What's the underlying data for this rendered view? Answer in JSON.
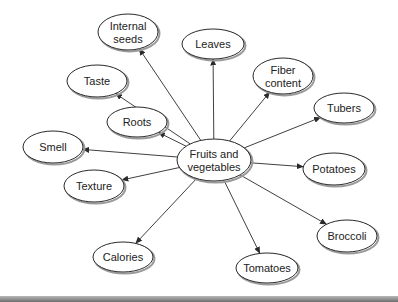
{
  "diagram": {
    "type": "concept-map",
    "center": {
      "id": "center",
      "lines": [
        "Fruits and",
        "vegetables"
      ],
      "cx": 214,
      "cy": 160,
      "rx": 37,
      "ry": 21
    },
    "nodes": [
      {
        "id": "internal-seeds",
        "lines": [
          "Internal",
          "seeds"
        ],
        "cx": 128,
        "cy": 32,
        "rx": 30,
        "ry": 18
      },
      {
        "id": "leaves",
        "lines": [
          "Leaves"
        ],
        "cx": 213,
        "cy": 44,
        "rx": 31,
        "ry": 15
      },
      {
        "id": "fiber-content",
        "lines": [
          "Fiber",
          "content"
        ],
        "cx": 283,
        "cy": 76,
        "rx": 30,
        "ry": 18
      },
      {
        "id": "tubers",
        "lines": [
          "Tubers"
        ],
        "cx": 344,
        "cy": 108,
        "rx": 30,
        "ry": 15
      },
      {
        "id": "taste",
        "lines": [
          "Taste"
        ],
        "cx": 97,
        "cy": 81,
        "rx": 30,
        "ry": 16
      },
      {
        "id": "roots",
        "lines": [
          "Roots"
        ],
        "cx": 137,
        "cy": 122,
        "rx": 30,
        "ry": 15
      },
      {
        "id": "smell",
        "lines": [
          "Smell"
        ],
        "cx": 53,
        "cy": 147,
        "rx": 30,
        "ry": 16
      },
      {
        "id": "potatoes",
        "lines": [
          "Potatoes"
        ],
        "cx": 334,
        "cy": 169,
        "rx": 31,
        "ry": 16
      },
      {
        "id": "texture",
        "lines": [
          "Texture"
        ],
        "cx": 94,
        "cy": 186,
        "rx": 30,
        "ry": 16
      },
      {
        "id": "broccoli",
        "lines": [
          "Broccoli"
        ],
        "cx": 347,
        "cy": 236,
        "rx": 30,
        "ry": 16
      },
      {
        "id": "calories",
        "lines": [
          "Calories"
        ],
        "cx": 123,
        "cy": 257,
        "rx": 30,
        "ry": 15
      },
      {
        "id": "tomatoes",
        "lines": [
          "Tomatoes"
        ],
        "cx": 267,
        "cy": 268,
        "rx": 31,
        "ry": 15
      }
    ],
    "edges": [
      {
        "from": "center",
        "to": "internal-seeds"
      },
      {
        "from": "center",
        "to": "leaves"
      },
      {
        "from": "center",
        "to": "fiber-content"
      },
      {
        "from": "center",
        "to": "tubers"
      },
      {
        "from": "center",
        "to": "taste"
      },
      {
        "from": "center",
        "to": "roots"
      },
      {
        "from": "center",
        "to": "smell"
      },
      {
        "from": "center",
        "to": "potatoes"
      },
      {
        "from": "center",
        "to": "texture"
      },
      {
        "from": "center",
        "to": "broccoli"
      },
      {
        "from": "center",
        "to": "calories"
      },
      {
        "from": "center",
        "to": "tomatoes"
      }
    ],
    "colors": {
      "stroke": "#2a2a2a",
      "shadow": "#9a9a9a",
      "fill": "#ffffff",
      "text": "#222222"
    }
  }
}
